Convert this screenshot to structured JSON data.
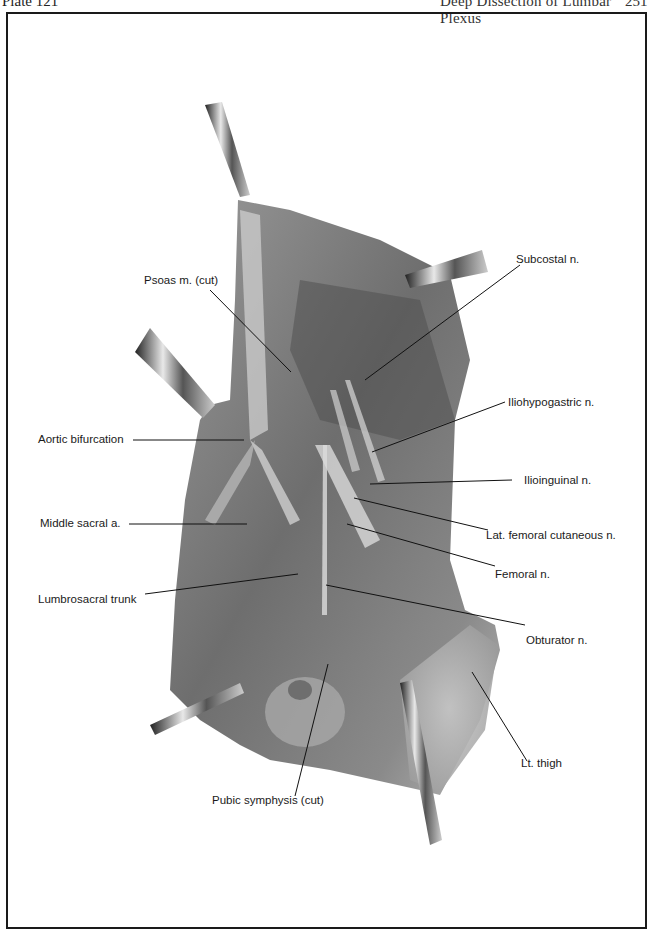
{
  "header": {
    "plate": "Plate 121",
    "title": "Deep Dissection of Lumbar Plexus",
    "page": "251"
  },
  "figure": {
    "labels": {
      "psoas": "Psoas m. (cut)",
      "subcostal": "Subcostal n.",
      "aortic_bifurcation": "Aortic bifurcation",
      "iliohypogastric": "Iliohypogastric n.",
      "ilioinguinal": "Ilioinguinal n.",
      "middle_sacral": "Middle sacral a.",
      "lat_femoral_cutaneous": "Lat. femoral cutaneous n.",
      "femoral": "Femoral n.",
      "lumbrosacral_trunk": "Lumbrosacral trunk",
      "obturator": "Obturator n.",
      "lt_thigh": "Lt. thigh",
      "pubic_symphysis": "Pubic symphysis (cut)"
    }
  }
}
